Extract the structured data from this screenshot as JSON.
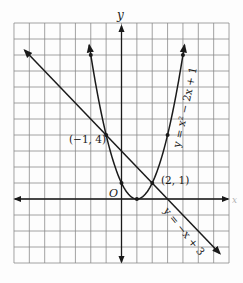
{
  "chart_data": {
    "type": "line",
    "title": "",
    "xlabel": "x",
    "ylabel": "y",
    "origin_label": "O",
    "xlim": [
      -7,
      7
    ],
    "ylim": [
      -4,
      11
    ],
    "grid": true,
    "legend": "none",
    "series": [
      {
        "name": "y = x² − 2x + 1",
        "kind": "parabola",
        "equation": "y = x^2 - 2x + 1",
        "x_range": [
          -2.1,
          4.1
        ],
        "marked_points": [
          [
            -2,
            9
          ],
          [
            -1,
            4
          ],
          [
            0,
            1
          ],
          [
            1,
            0
          ],
          [
            2,
            1
          ],
          [
            3,
            4
          ],
          [
            4,
            9
          ]
        ],
        "label": "y = x² − 2x + 1"
      },
      {
        "name": "y = −x + 3",
        "kind": "line",
        "equation": "y = -x + 3",
        "x_range": [
          -6.3,
          6.4
        ],
        "marked_points": [],
        "label": "y = −x + 3"
      }
    ],
    "annotations": [
      {
        "text": "(−1, 4)",
        "x": -1,
        "y": 4
      },
      {
        "text": "(2, 1)",
        "x": 2,
        "y": 1
      }
    ]
  },
  "colors": {
    "grid": "#8a8a8a",
    "ink": "#1a1a1a",
    "background": "#fdfdfd"
  }
}
